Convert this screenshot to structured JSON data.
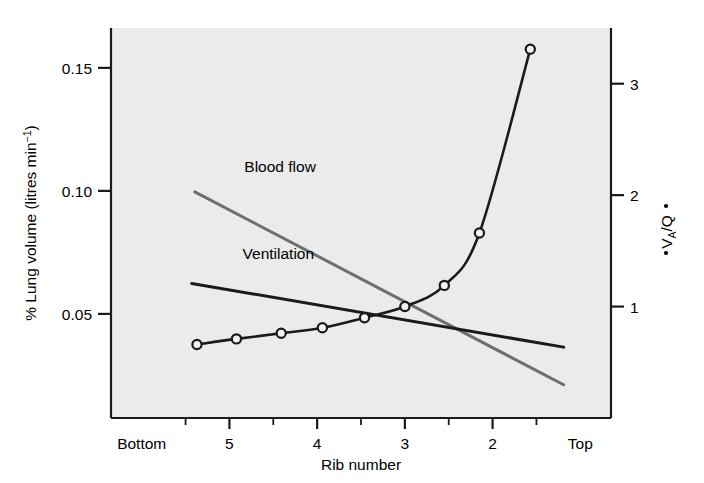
{
  "chart_data": {
    "type": "line",
    "title": "",
    "subtitle": "",
    "plot_background": "#ebebeb",
    "grid": false,
    "legend_position": "inline-annotations",
    "xlabel": "Rib number",
    "x_tick_labels": [
      "Bottom",
      "5",
      "4",
      "3",
      "2",
      "Top"
    ],
    "x_tick_values": [
      0,
      1,
      2,
      3,
      4,
      5
    ],
    "x_minor_ticks": [
      0.5,
      1.5,
      2.5,
      3.5,
      4.5
    ],
    "xlim": [
      -0.35,
      5.35
    ],
    "ylabel_left": "% Lung volume (litres min",
    "ylabel_left_exponent": "−1",
    "ylabel_left_tail": ")",
    "y_left_tick_labels": [
      "0.05",
      "0.10",
      "0.15"
    ],
    "y_left_tick_values": [
      0.05,
      0.1,
      0.15
    ],
    "ylim_left": [
      0.0077,
      0.1662
    ],
    "ylabel_right_parts": [
      "V",
      "A",
      "/",
      "Q"
    ],
    "ylabel_right_text": "V̇A/Q̇",
    "y_right_tick_labels": [
      "1",
      "2",
      "3"
    ],
    "y_right_tick_values": [
      1,
      2,
      3
    ],
    "ylim_right": [
      0.0,
      3.5
    ],
    "series": [
      {
        "name": "Blood flow",
        "color": "#6e6e6e",
        "axis": "left",
        "style": "straight-line",
        "marker": "none",
        "label_x": 1.17,
        "label_y": 0.1075,
        "x": [
          0.605,
          4.81
        ],
        "values": [
          0.0996,
          0.0212
        ]
      },
      {
        "name": "Ventilation",
        "color": "#1a1a1a",
        "axis": "left",
        "style": "straight-line",
        "marker": "none",
        "label_x": 1.15,
        "label_y": 0.0722,
        "x": [
          0.57,
          4.81
        ],
        "values": [
          0.0624,
          0.0365
        ]
      },
      {
        "name": "V̇A/Q̇",
        "color": "#1a1a1a",
        "axis": "right",
        "style": "smooth-curve",
        "marker": "open-circle",
        "x": [
          0.63,
          1.08,
          1.59,
          2.06,
          2.54,
          3.0,
          3.45,
          3.85,
          4.43
        ],
        "values": [
          0.66,
          0.71,
          0.76,
          0.81,
          0.9,
          1.0,
          1.19,
          1.66,
          3.31
        ]
      }
    ]
  },
  "figure": {
    "plot_area": {
      "left": 111,
      "top": 28,
      "right": 611,
      "bottom": 418
    }
  }
}
